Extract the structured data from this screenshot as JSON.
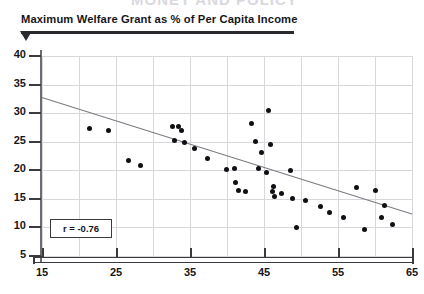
{
  "page": {
    "cutoff_headline": "MONEY AND POLICY",
    "title": "Maximum Welfare Grant as % of Per Capita Income",
    "annotation_box": "r = -0.76"
  },
  "chart_data": {
    "type": "scatter",
    "title": "Maximum Welfare Grant as % of Per Capita Income",
    "xlabel": "",
    "ylabel": "",
    "xlim": [
      15,
      65
    ],
    "ylim": [
      3,
      41
    ],
    "xticks": [
      15,
      25,
      35,
      45,
      55,
      65
    ],
    "yticks": [
      5,
      10,
      15,
      20,
      25,
      30,
      35,
      40
    ],
    "x_minor_gridlines": [
      20,
      30,
      40,
      50,
      60
    ],
    "grid": true,
    "legend": null,
    "annotations": [
      {
        "text": "r = -0.76",
        "x": 19.5,
        "y": 11.5
      }
    ],
    "regression_line": {
      "x0": 15.0,
      "y0": 32.8,
      "x1": 65.0,
      "y1": 12.4,
      "color": "#7b7b80",
      "label": "fitted trend line"
    },
    "point_color": "#101014",
    "points": [
      {
        "x": 21.4,
        "y": 27.3
      },
      {
        "x": 24.0,
        "y": 26.9
      },
      {
        "x": 26.7,
        "y": 21.8
      },
      {
        "x": 28.3,
        "y": 20.9
      },
      {
        "x": 32.6,
        "y": 27.6
      },
      {
        "x": 33.5,
        "y": 27.7
      },
      {
        "x": 33.9,
        "y": 27.0
      },
      {
        "x": 32.9,
        "y": 25.2
      },
      {
        "x": 34.3,
        "y": 24.9
      },
      {
        "x": 35.6,
        "y": 23.8
      },
      {
        "x": 37.4,
        "y": 22.0
      },
      {
        "x": 39.9,
        "y": 20.2
      },
      {
        "x": 41.0,
        "y": 20.3
      },
      {
        "x": 41.2,
        "y": 17.9
      },
      {
        "x": 41.6,
        "y": 16.4
      },
      {
        "x": 42.5,
        "y": 16.3
      },
      {
        "x": 43.3,
        "y": 28.2
      },
      {
        "x": 43.9,
        "y": 25.0
      },
      {
        "x": 44.6,
        "y": 23.1
      },
      {
        "x": 45.6,
        "y": 30.5
      },
      {
        "x": 45.9,
        "y": 24.5
      },
      {
        "x": 44.2,
        "y": 20.3
      },
      {
        "x": 45.4,
        "y": 19.7
      },
      {
        "x": 46.3,
        "y": 17.1
      },
      {
        "x": 46.1,
        "y": 16.3
      },
      {
        "x": 46.4,
        "y": 15.5
      },
      {
        "x": 47.4,
        "y": 15.9
      },
      {
        "x": 48.6,
        "y": 20.0
      },
      {
        "x": 48.9,
        "y": 15.0
      },
      {
        "x": 50.6,
        "y": 14.8
      },
      {
        "x": 49.4,
        "y": 10.0
      },
      {
        "x": 52.6,
        "y": 13.6
      },
      {
        "x": 53.8,
        "y": 12.6
      },
      {
        "x": 55.8,
        "y": 11.7
      },
      {
        "x": 57.5,
        "y": 17.0
      },
      {
        "x": 58.6,
        "y": 9.6
      },
      {
        "x": 60.1,
        "y": 16.4
      },
      {
        "x": 61.3,
        "y": 13.9
      },
      {
        "x": 60.9,
        "y": 11.8
      },
      {
        "x": 62.4,
        "y": 10.6
      }
    ]
  }
}
